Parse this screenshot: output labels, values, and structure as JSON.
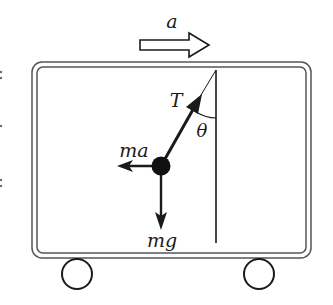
{
  "diagram": {
    "type": "physics-free-body",
    "colors": {
      "stroke": "#1a1a1a",
      "box_stroke": "#555555",
      "background": "#ffffff"
    },
    "labels": {
      "acceleration": "a",
      "tension": "T",
      "angle": "θ",
      "pseudo_force": "ma",
      "weight": "mg"
    },
    "cart": {
      "outer": {
        "x": 32,
        "y": 62,
        "w": 279,
        "h": 196,
        "r": 10
      },
      "inner": {
        "x": 37,
        "y": 67,
        "w": 269,
        "h": 186,
        "r": 6
      },
      "wheels": [
        {
          "cx": 77,
          "cy": 274,
          "r": 15
        },
        {
          "cx": 259,
          "cy": 274,
          "r": 15
        }
      ]
    },
    "pendulum": {
      "pivot": {
        "x": 216,
        "y": 70
      },
      "bob": {
        "cx": 161,
        "cy": 166,
        "r": 9
      },
      "vertical_line_end_y": 243
    },
    "arrows": {
      "acceleration": {
        "from_x": 140,
        "to_x": 209,
        "y": 45
      },
      "pseudo_force": {
        "to_x": 117,
        "y": 166
      },
      "weight": {
        "to_y": 230,
        "x": 161
      }
    }
  }
}
